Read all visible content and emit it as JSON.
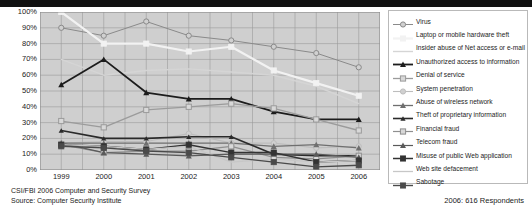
{
  "footer": {
    "line1": "CSI/FBI 2006 Computer and Security Survey",
    "line2": "Source: Computer Security Institute",
    "respondents": "2006: 616 Respondents"
  },
  "chart_data": {
    "type": "line",
    "title": "",
    "xlabel": "",
    "ylabel": "",
    "ylim": [
      0,
      100
    ],
    "ytick_labels": [
      "100%",
      "90%",
      "80%",
      "70%",
      "60%",
      "50%",
      "40%",
      "30%",
      "20%",
      "10%",
      "0%"
    ],
    "ytick_values": [
      100,
      90,
      80,
      70,
      60,
      50,
      40,
      30,
      20,
      10,
      0
    ],
    "grid": true,
    "legend_position": "right",
    "categories": [
      "1999",
      "2000",
      "2001",
      "2002",
      "2003",
      "2004",
      "2005",
      "2006"
    ],
    "series": [
      {
        "name": "Virus",
        "color": "#8a8a8a",
        "marker": "circle-open",
        "width": 1,
        "values": [
          90,
          85,
          94,
          85,
          82,
          78,
          74,
          65
        ]
      },
      {
        "name": "Laptop or mobile hardware theft",
        "color": "#f2f2f2",
        "marker": "square",
        "width": 2.2,
        "values": [
          100,
          80,
          80,
          75,
          78,
          63,
          55,
          47
        ]
      },
      {
        "name": "Insider abuse of  Net access or e-mail",
        "color": "#d5d5d5",
        "marker": "none",
        "width": 1.4,
        "values": [
          70,
          60,
          63,
          64,
          62,
          60,
          53,
          42
        ]
      },
      {
        "name": "Unauthorized access to information",
        "color": "#1c1c1c",
        "marker": "triangle",
        "width": 1.8,
        "values": [
          54,
          70,
          49,
          45,
          45,
          37,
          32,
          32
        ]
      },
      {
        "name": "Denial of service",
        "color": "#9b9b9b",
        "marker": "square-open",
        "width": 1.3,
        "values": [
          31,
          27,
          38,
          40,
          42,
          39,
          32,
          25
        ]
      },
      {
        "name": "System penetration",
        "color": "#bdbdbd",
        "marker": "circle-open",
        "width": 1.1,
        "values": [
          17,
          18,
          18,
          23,
          17,
          17,
          14,
          15
        ]
      },
      {
        "name": "Abuse of wireless network",
        "color": "#6f6f6f",
        "marker": "triangle",
        "width": 1.3,
        "values": [
          17,
          17,
          17,
          17,
          17,
          15,
          16,
          14
        ]
      },
      {
        "name": "Theft of proprietary information",
        "color": "#2a2a2a",
        "marker": "triangle-sm",
        "width": 1.6,
        "values": [
          25,
          20,
          20,
          21,
          21,
          10,
          9,
          9
        ]
      },
      {
        "name": "Financial fraud",
        "color": "#8f8f8f",
        "marker": "square-open",
        "width": 1.2,
        "values": [
          16,
          11,
          12,
          12,
          15,
          8,
          7,
          9
        ]
      },
      {
        "name": "Telecom fraud",
        "color": "#5a5a5a",
        "marker": "triangle",
        "width": 1.2,
        "values": [
          17,
          11,
          10,
          9,
          10,
          10,
          10,
          8
        ]
      },
      {
        "name": "Misuse of public Web application",
        "color": "#333333",
        "marker": "square",
        "width": 1.5,
        "values": [
          16,
          15,
          13,
          16,
          11,
          11,
          5,
          6
        ]
      },
      {
        "name": "Web site defacement",
        "color": "#c7c7c7",
        "marker": "none",
        "width": 1.3,
        "values": [
          16,
          15,
          13,
          15,
          5,
          7,
          5,
          6
        ]
      },
      {
        "name": "Sabotage",
        "color": "#4a4a4a",
        "marker": "square",
        "width": 1.4,
        "values": [
          15,
          14,
          12,
          11,
          8,
          5,
          2,
          3
        ]
      }
    ]
  }
}
